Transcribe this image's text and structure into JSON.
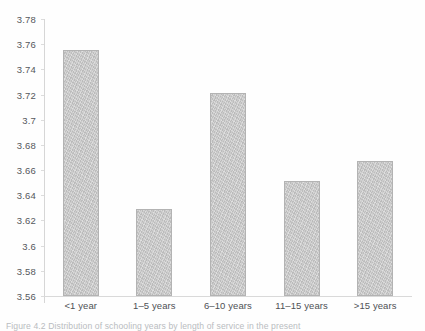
{
  "chart_data": {
    "type": "bar",
    "title": "",
    "subtitle": "",
    "xlabel": "",
    "ylabel": "",
    "categories": [
      "<1 year",
      "1–5 years",
      "6–10 years",
      "11–15 years",
      ">15 years"
    ],
    "values": [
      3.755,
      3.629,
      3.721,
      3.651,
      3.667
    ],
    "ylim": [
      3.56,
      3.78
    ],
    "ytick_step": 0.02,
    "ytick_labels": [
      "3.78",
      "3.76",
      "3.74",
      "3.72",
      "3.7",
      "3.68",
      "3.66",
      "3.64",
      "3.62",
      "3.6",
      "3.58",
      "3.56"
    ],
    "ytick_values": [
      3.78,
      3.76,
      3.74,
      3.72,
      3.7,
      3.68,
      3.66,
      3.64,
      3.62,
      3.6,
      3.58,
      3.56
    ],
    "grid": false,
    "legend": "none",
    "bar_color": "#c6c6c6",
    "bar_border_color": "#b3b3b3",
    "axis_color": "#d9d9d9",
    "text_color": "#55585c"
  },
  "figure": {
    "caption": "Figure 4.2 Distribution of schooling years by length of service in the present"
  }
}
